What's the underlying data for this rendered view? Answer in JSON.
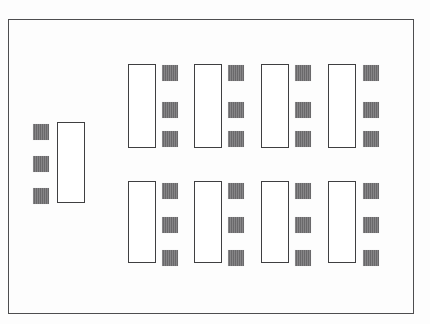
{
  "diagram": {
    "canvas": {
      "width": 430,
      "height": 324,
      "background": "#fdfdfd"
    },
    "frame": {
      "label": "outer-enclosure",
      "x": 8,
      "y": 19,
      "width": 406,
      "height": 295,
      "stroke": "#4d4d4f",
      "stroke_width": 1.6
    },
    "styles": {
      "bay_stroke": "#3f3f41",
      "bay_fill": "#ffffff",
      "bay_stroke_width": 1.7,
      "module_fill": "#6f6e70"
    },
    "module_size": {
      "width": 16,
      "height": 16
    },
    "bay_size": {
      "width": 28,
      "height": 84
    },
    "left_group": {
      "label": "left-assembly",
      "bay": {
        "label": "left-bay",
        "x": 57,
        "y": 122,
        "width": 28,
        "height": 81
      },
      "modules": [
        {
          "label": "left-module-1",
          "x": 33,
          "y": 124
        },
        {
          "label": "left-module-2",
          "x": 33,
          "y": 156
        },
        {
          "label": "left-module-3",
          "x": 33,
          "y": 188
        }
      ]
    },
    "grid": {
      "label": "module-array",
      "rows": 2,
      "columns": 4,
      "row_y": [
        64,
        181
      ],
      "column_x": [
        128,
        194,
        261,
        328
      ],
      "module_offset_x": 34,
      "module_row_offsets": [
        1,
        38,
        75
      ],
      "cells": [
        {
          "label": "cell-r1-c1",
          "row": 1,
          "column": 1,
          "bay": {
            "x": 128,
            "y": 64,
            "width": 28,
            "height": 84
          },
          "modules": [
            {
              "x": 162,
              "y": 65
            },
            {
              "x": 162,
              "y": 102
            },
            {
              "x": 162,
              "y": 131
            }
          ]
        },
        {
          "label": "cell-r1-c2",
          "row": 1,
          "column": 2,
          "bay": {
            "x": 194,
            "y": 64,
            "width": 28,
            "height": 84
          },
          "modules": [
            {
              "x": 228,
              "y": 65
            },
            {
              "x": 228,
              "y": 102
            },
            {
              "x": 228,
              "y": 131
            }
          ]
        },
        {
          "label": "cell-r1-c3",
          "row": 1,
          "column": 3,
          "bay": {
            "x": 261,
            "y": 64,
            "width": 28,
            "height": 84
          },
          "modules": [
            {
              "x": 295,
              "y": 65
            },
            {
              "x": 295,
              "y": 102
            },
            {
              "x": 295,
              "y": 131
            }
          ]
        },
        {
          "label": "cell-r1-c4",
          "row": 1,
          "column": 4,
          "bay": {
            "x": 328,
            "y": 64,
            "width": 28,
            "height": 84
          },
          "modules": [
            {
              "x": 363,
              "y": 65
            },
            {
              "x": 363,
              "y": 102
            },
            {
              "x": 363,
              "y": 131
            }
          ]
        },
        {
          "label": "cell-r2-c1",
          "row": 2,
          "column": 1,
          "bay": {
            "x": 128,
            "y": 181,
            "width": 28,
            "height": 82
          },
          "modules": [
            {
              "x": 162,
              "y": 183
            },
            {
              "x": 162,
              "y": 217
            },
            {
              "x": 162,
              "y": 250
            }
          ]
        },
        {
          "label": "cell-r2-c2",
          "row": 2,
          "column": 2,
          "bay": {
            "x": 194,
            "y": 181,
            "width": 28,
            "height": 82
          },
          "modules": [
            {
              "x": 228,
              "y": 183
            },
            {
              "x": 228,
              "y": 217
            },
            {
              "x": 228,
              "y": 250
            }
          ]
        },
        {
          "label": "cell-r2-c3",
          "row": 2,
          "column": 3,
          "bay": {
            "x": 261,
            "y": 181,
            "width": 28,
            "height": 82
          },
          "modules": [
            {
              "x": 295,
              "y": 183
            },
            {
              "x": 295,
              "y": 217
            },
            {
              "x": 295,
              "y": 250
            }
          ]
        },
        {
          "label": "cell-r2-c4",
          "row": 2,
          "column": 4,
          "bay": {
            "x": 328,
            "y": 181,
            "width": 28,
            "height": 82
          },
          "modules": [
            {
              "x": 363,
              "y": 183
            },
            {
              "x": 363,
              "y": 217
            },
            {
              "x": 363,
              "y": 250
            }
          ]
        }
      ]
    }
  }
}
